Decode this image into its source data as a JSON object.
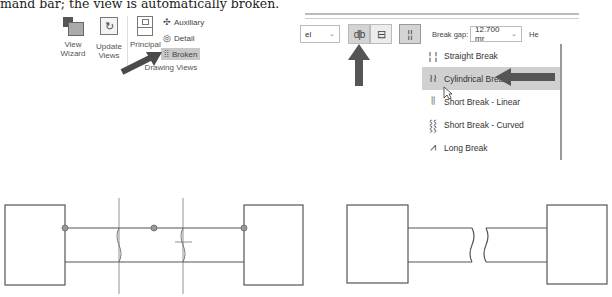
{
  "caption": "mand bar; the view is automatically broken.",
  "ribbon": {
    "buttons": [
      {
        "label_line1": "View",
        "label_line2": "Wizard",
        "icon": "view-wizard-icon"
      },
      {
        "label_line1": "Update",
        "label_line2": "Views",
        "icon": "update-views-icon"
      },
      {
        "label_line1": "Principal",
        "label_line2": "",
        "icon": "principal-view-icon"
      }
    ],
    "small_buttons": [
      {
        "label": "Auxiliary",
        "icon": "auxiliary-icon"
      },
      {
        "label": "Detail",
        "icon": "detail-icon"
      },
      {
        "label": "Broken",
        "icon": "broken-view-icon",
        "highlighted": true
      }
    ],
    "group_label": "Drawing Views"
  },
  "toolbar": {
    "combo_value": "el",
    "orientation_buttons": [
      {
        "glyph": "d|b",
        "name": "vertical-break",
        "active": true
      },
      {
        "glyph": "⊟",
        "name": "horizontal-break",
        "active": false
      }
    ],
    "break_style_glyph": "¦¦",
    "break_gap_label": "Break gap:",
    "break_gap_value": "12.700 mr",
    "height_label_partial": "He"
  },
  "break_style_menu": {
    "items": [
      {
        "label": "Straight Break",
        "icon": "straight-break-icon",
        "glyph": "¦ ¦"
      },
      {
        "label": "Cylindrical Break",
        "icon": "cylindrical-break-icon",
        "glyph": "≀≀",
        "selected": true
      },
      {
        "label": "Short Break - Linear",
        "icon": "short-break-linear-icon",
        "glyph": "⦚⦚"
      },
      {
        "label": "Short Break - Curved",
        "icon": "short-break-curved-icon",
        "glyph": "⸾⸾"
      },
      {
        "label": "Long Break",
        "icon": "long-break-icon",
        "glyph": "⩘"
      }
    ]
  },
  "colors": {
    "arrow": "#555555",
    "line": "#555555",
    "highlight": "#d0d0d0"
  }
}
